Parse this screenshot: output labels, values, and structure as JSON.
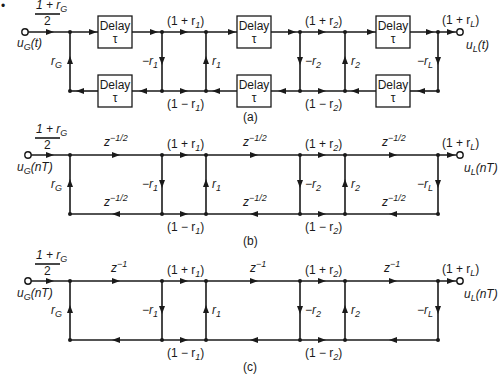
{
  "figure": {
    "bullet": "•",
    "panels": [
      {
        "id": "a",
        "caption": "(a)",
        "input_gain": {
          "num": "1 + r",
          "num_sub": "G",
          "den": "2"
        },
        "input_label": {
          "base": "u",
          "sub": "G",
          "arg": "(t)"
        },
        "output_label": {
          "base": "u",
          "sub": "L",
          "arg": "(t)"
        },
        "delay_label": "Delay",
        "delay_symbol": "τ",
        "top_labels": [
          {
            "pre": "(1 + r",
            "sub": "1",
            "post": ")"
          },
          {
            "pre": "(1 + r",
            "sub": "2",
            "post": ")"
          },
          {
            "pre": "(1 + r",
            "sub": "L",
            "post": ")"
          }
        ],
        "bottom_labels": [
          {
            "pre": "(1 − r",
            "sub": "1",
            "post": ")"
          },
          {
            "pre": "(1 − r",
            "sub": "2",
            "post": ")"
          }
        ],
        "vertical_labels": [
          {
            "pre": "r",
            "sub": "G"
          },
          {
            "pre": "−r",
            "sub": "1"
          },
          {
            "pre": "r",
            "sub": "1"
          },
          {
            "pre": "−r",
            "sub": "2"
          },
          {
            "pre": "r",
            "sub": "2"
          },
          {
            "pre": "−r",
            "sub": "L"
          }
        ]
      },
      {
        "id": "b",
        "caption": "(b)",
        "input_gain": {
          "num": "1 + r",
          "num_sub": "G",
          "den": "2"
        },
        "input_label": {
          "base": "u",
          "sub": "G",
          "arg": "(nT)"
        },
        "output_label": {
          "base": "u",
          "sub": "L",
          "arg": "(nT)"
        },
        "delay_base": "z",
        "delay_exp": "−1/2",
        "top_labels": [
          {
            "pre": "(1 + r",
            "sub": "1",
            "post": ")"
          },
          {
            "pre": "(1 + r",
            "sub": "2",
            "post": ")"
          },
          {
            "pre": "(1 + r",
            "sub": "L",
            "post": ")"
          }
        ],
        "bottom_labels": [
          {
            "pre": "(1 − r",
            "sub": "1",
            "post": ")"
          },
          {
            "pre": "(1 − r",
            "sub": "2",
            "post": ")"
          }
        ],
        "vertical_labels": [
          {
            "pre": "r",
            "sub": "G"
          },
          {
            "pre": "−r",
            "sub": "1"
          },
          {
            "pre": "r",
            "sub": "1"
          },
          {
            "pre": "−r",
            "sub": "2"
          },
          {
            "pre": "r",
            "sub": "2"
          },
          {
            "pre": "−r",
            "sub": "L"
          }
        ]
      },
      {
        "id": "c",
        "caption": "(c)",
        "input_gain": {
          "num": "1 + r",
          "num_sub": "G",
          "den": "2"
        },
        "input_label": {
          "base": "u",
          "sub": "G",
          "arg": "(nT)"
        },
        "output_label": {
          "base": "u",
          "sub": "L",
          "arg": "(nT)"
        },
        "delay_base": "z",
        "delay_exp": "−1",
        "top_labels": [
          {
            "pre": "(1 + r",
            "sub": "1",
            "post": ")"
          },
          {
            "pre": "(1 + r",
            "sub": "2",
            "post": ")"
          },
          {
            "pre": "(1 + r",
            "sub": "L",
            "post": ")"
          }
        ],
        "bottom_labels": [
          {
            "pre": "(1 − r",
            "sub": "1",
            "post": ")"
          },
          {
            "pre": "(1 − r",
            "sub": "2",
            "post": ")"
          }
        ],
        "vertical_labels": [
          {
            "pre": "r",
            "sub": "G"
          },
          {
            "pre": "−r",
            "sub": "1"
          },
          {
            "pre": "r",
            "sub": "1"
          },
          {
            "pre": "−r",
            "sub": "2"
          },
          {
            "pre": "r",
            "sub": "2"
          },
          {
            "pre": "−r",
            "sub": "L"
          }
        ]
      }
    ]
  }
}
